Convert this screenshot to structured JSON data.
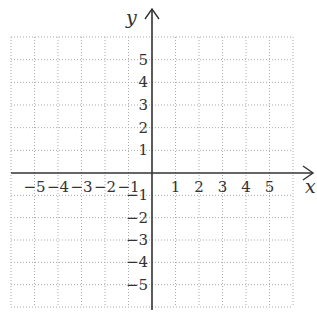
{
  "chart_data": {
    "type": "grid",
    "title": "",
    "xlabel": "x",
    "ylabel": "y",
    "xlim": [
      -6,
      6
    ],
    "ylim": [
      -6,
      6
    ],
    "grid": true,
    "grid_style": "dotted",
    "x_ticks": [
      -5,
      -4,
      -3,
      -2,
      -1,
      1,
      2,
      3,
      4,
      5
    ],
    "y_ticks": [
      5,
      4,
      3,
      2,
      1,
      -1,
      -2,
      -3,
      -4,
      -5
    ],
    "x_tick_labels": [
      "−5",
      "−4",
      "−3",
      "−2",
      "−1",
      "1",
      "2",
      "3",
      "4",
      "5"
    ],
    "y_tick_labels": [
      "5",
      "4",
      "3",
      "2",
      "1",
      "−1",
      "−2",
      "−3",
      "−4",
      "−5"
    ],
    "series": []
  },
  "colors": {
    "axis": "#333333",
    "grid": "#aaaaaa",
    "text": "#333333",
    "background": "#ffffff"
  }
}
